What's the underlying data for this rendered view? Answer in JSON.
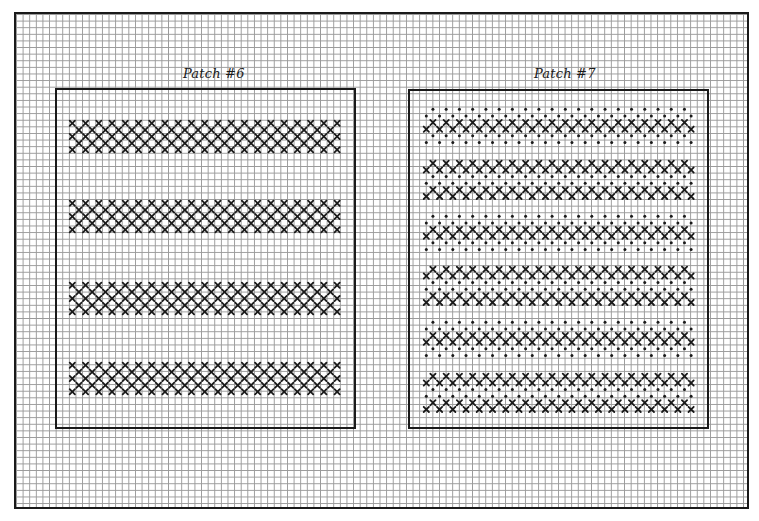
{
  "chart_data": {
    "type": "grid-pattern",
    "grid": {
      "cell_px": 6.62,
      "frame": {
        "x": 14,
        "y": 12,
        "w": 735,
        "h": 497
      }
    },
    "legend": {
      "x_symbol": "cross stitch",
      "dot_symbol": "dot stitch"
    },
    "patches": [
      {
        "id": "patch-6",
        "label": "Patch #6",
        "box": {
          "x": 55,
          "y": 88,
          "w": 301,
          "h": 341
        },
        "title_pos": {
          "x": 183,
          "y": 66
        },
        "columns": 41,
        "band_start_x": 69,
        "bands": [
          {
            "y": 120,
            "rows": [
              "x-even",
              "x-odd",
              "x-even",
              "x-odd",
              "x-even"
            ]
          },
          {
            "y": 200,
            "rows": [
              "x-even",
              "x-odd",
              "x-even",
              "x-odd",
              "x-even"
            ]
          },
          {
            "y": 282,
            "rows": [
              "x-even",
              "x-odd",
              "x-even",
              "x-odd",
              "x-even"
            ]
          },
          {
            "y": 362,
            "rows": [
              "x-even",
              "x-odd",
              "x-even",
              "x-odd",
              "x-even"
            ]
          }
        ]
      },
      {
        "id": "patch-7",
        "label": "Patch #7",
        "box": {
          "x": 408,
          "y": 89,
          "w": 301,
          "h": 340
        },
        "title_pos": {
          "x": 534,
          "y": 66
        },
        "columns": 41,
        "band_start_x": 423,
        "bands": [
          {
            "y": 106,
            "rows": [
              "dot-odd",
              "dot-even",
              "x-odd",
              "x-even",
              "dot-odd",
              "dot-even"
            ]
          },
          {
            "y": 160,
            "rows": [
              "x-odd",
              "x-even",
              "dot-odd",
              "dot-even",
              "x-odd",
              "x-even"
            ]
          },
          {
            "y": 213,
            "rows": [
              "dot-odd",
              "dot-even",
              "x-odd",
              "x-even",
              "dot-odd",
              "dot-even"
            ]
          },
          {
            "y": 266,
            "rows": [
              "x-odd",
              "x-even",
              "dot-odd",
              "dot-even",
              "x-odd",
              "x-even"
            ]
          },
          {
            "y": 319,
            "rows": [
              "dot-odd",
              "dot-even",
              "x-odd",
              "x-even",
              "dot-odd",
              "dot-even"
            ]
          },
          {
            "y": 373,
            "rows": [
              "x-odd",
              "x-even",
              "dot-odd",
              "dot-even",
              "x-odd",
              "x-even"
            ]
          }
        ]
      }
    ],
    "colors": {
      "ink": "#1a1a1a",
      "grid": "#9a9a9a",
      "paper": "#ffffff"
    }
  }
}
